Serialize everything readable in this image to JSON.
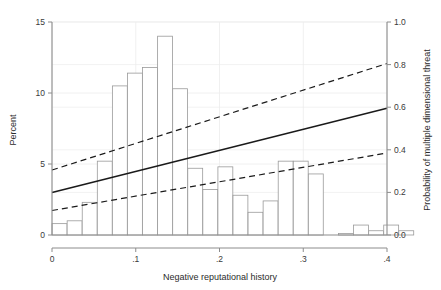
{
  "chart_data": {
    "type": "bar",
    "title": "",
    "subtitle": "",
    "xlabel": "Negative reputational history",
    "ylabel": "Percent",
    "y2label": "Probability of multiple dimensional threat",
    "xlim": [
      0,
      0.4
    ],
    "ylim": [
      0,
      15
    ],
    "y2lim": [
      0.0,
      1.0
    ],
    "grid": true,
    "legend": "none",
    "xticks": [
      "0",
      ".1",
      ".2",
      ".3",
      ".4"
    ],
    "xtick_values": [
      0,
      0.1,
      0.2,
      0.3,
      0.4
    ],
    "yticks": [
      "0",
      "5",
      "10",
      "15"
    ],
    "ytick_values": [
      0,
      5,
      10,
      15
    ],
    "y2ticks": [
      "0.0",
      "0.2",
      "0.4",
      "0.6",
      "0.8",
      "1.0"
    ],
    "y2tick_values": [
      0.0,
      0.2,
      0.4,
      0.6,
      0.8,
      1.0
    ],
    "bar_width": 0.0178,
    "bars": [
      {
        "x": 0.009,
        "value": 0.8
      },
      {
        "x": 0.027,
        "value": 1.0
      },
      {
        "x": 0.045,
        "value": 2.3
      },
      {
        "x": 0.063,
        "value": 5.2
      },
      {
        "x": 0.081,
        "value": 10.5
      },
      {
        "x": 0.099,
        "value": 11.4
      },
      {
        "x": 0.117,
        "value": 11.8
      },
      {
        "x": 0.135,
        "value": 14.0
      },
      {
        "x": 0.153,
        "value": 10.3
      },
      {
        "x": 0.171,
        "value": 4.7
      },
      {
        "x": 0.189,
        "value": 3.2
      },
      {
        "x": 0.207,
        "value": 4.8
      },
      {
        "x": 0.225,
        "value": 2.8
      },
      {
        "x": 0.243,
        "value": 1.6
      },
      {
        "x": 0.261,
        "value": 2.4
      },
      {
        "x": 0.279,
        "value": 5.2
      },
      {
        "x": 0.297,
        "value": 5.2
      },
      {
        "x": 0.315,
        "value": 4.3
      },
      {
        "x": 0.351,
        "value": 0.1
      },
      {
        "x": 0.369,
        "value": 0.7
      },
      {
        "x": 0.387,
        "value": 0.3
      },
      {
        "x": 0.405,
        "value": 0.7
      },
      {
        "x": 0.423,
        "value": 0.3
      }
    ],
    "series": [
      {
        "name": "fitted probability",
        "style": "solid",
        "axis": "right",
        "x": [
          0.0,
          0.4
        ],
        "values": [
          0.2,
          0.595
        ]
      },
      {
        "name": "upper confidence bound",
        "style": "dashed",
        "axis": "right",
        "x": [
          0.0,
          0.4
        ],
        "values": [
          0.305,
          0.805
        ]
      },
      {
        "name": "lower confidence bound",
        "style": "dashed",
        "axis": "right",
        "x": [
          0.0,
          0.4
        ],
        "values": [
          0.115,
          0.385
        ]
      }
    ]
  },
  "colors": {
    "bar_edge": "#9a9a9a",
    "bar_fill": "#ffffff",
    "line": "#1a1a1a",
    "grid": "#ececec",
    "axis": "#8c8c8c",
    "text": "#333333",
    "background": "#ffffff"
  }
}
